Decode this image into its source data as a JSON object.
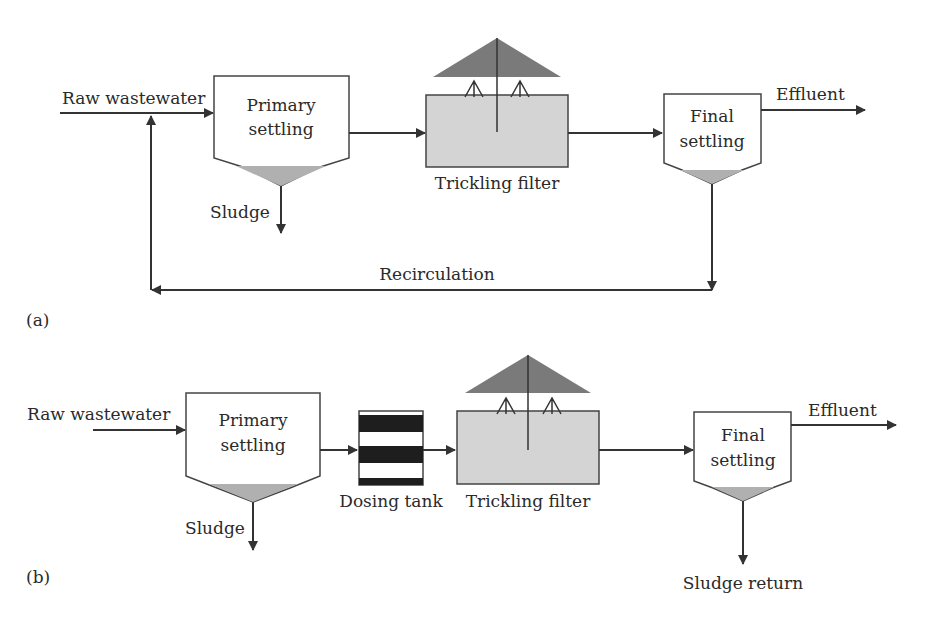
{
  "diagram_a": {
    "panel_label": "(a)",
    "inlet": "Raw wastewater",
    "primary": [
      "Primary",
      "settling"
    ],
    "primary_sludge": "Sludge",
    "filter": "Trickling filter",
    "final": [
      "Final",
      "settling"
    ],
    "effluent": "Effluent",
    "recirculation": "Recirculation"
  },
  "diagram_b": {
    "panel_label": "(b)",
    "inlet": "Raw wastewater",
    "primary": [
      "Primary",
      "settling"
    ],
    "primary_sludge": "Sludge",
    "dosing": "Dosing tank",
    "filter": "Trickling filter",
    "final": [
      "Final",
      "settling"
    ],
    "effluent": "Effluent",
    "sludge_return": "Sludge return"
  },
  "colors": {
    "line": "#333333",
    "sludge_fill": "#b0b0b0",
    "filter_fill": "#d4d4d4",
    "distributor_fill": "#7a7a7a",
    "dosing_band": "#1e1e1e"
  }
}
